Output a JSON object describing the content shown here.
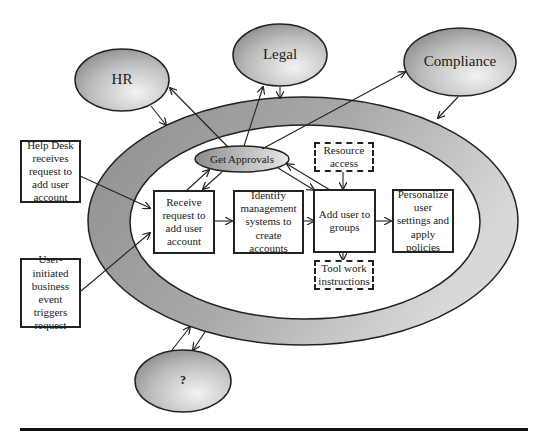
{
  "diagram": {
    "stakeholders": [
      {
        "id": "hr",
        "label": "HR"
      },
      {
        "id": "legal",
        "label": "Legal"
      },
      {
        "id": "compliance",
        "label": "Compliance"
      },
      {
        "id": "unknown",
        "label": "?"
      }
    ],
    "triggers": [
      {
        "id": "helpdesk",
        "label": "Help Desk receives request to add user account"
      },
      {
        "id": "user_event",
        "label": "User-initiated business event triggers request"
      }
    ],
    "approvals": {
      "label": "Get Approvals"
    },
    "process_steps": [
      {
        "id": "receive",
        "label": "Receive request to add user account"
      },
      {
        "id": "identify",
        "label": "Identify management systems to create accounts"
      },
      {
        "id": "add_groups",
        "label": "Add user to groups"
      },
      {
        "id": "personalize",
        "label": "Personalize user settings and apply policies"
      }
    ],
    "inputs": [
      {
        "id": "resource_access",
        "label": "Resource access",
        "style": "dashed"
      },
      {
        "id": "tool_work",
        "label": "Tool work instructions",
        "style": "dashed"
      }
    ],
    "colors": {
      "ring": "#a8a8a8",
      "ellipse_dark": "#8a8a8a",
      "ellipse_light": "#e8e8e8",
      "stroke": "#222222"
    }
  }
}
